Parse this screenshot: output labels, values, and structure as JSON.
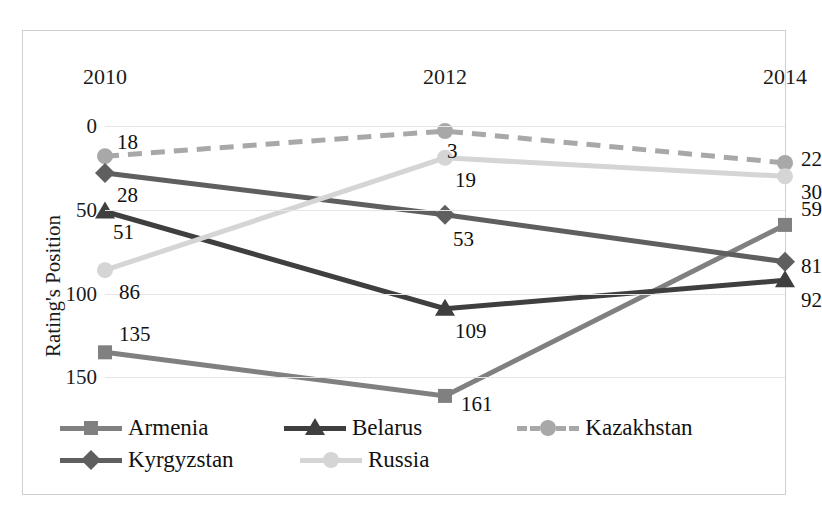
{
  "chart_data": {
    "type": "line",
    "title": "",
    "xlabel": "",
    "ylabel": "Rating's Position",
    "categories": [
      "2010",
      "2012",
      "2014"
    ],
    "x_tick_labels": [
      "2010",
      "2012",
      "2014"
    ],
    "y_tick_labels": [
      "0",
      "50",
      "100",
      "150"
    ],
    "y_ticks": [
      0,
      50,
      100,
      150
    ],
    "ylim": [
      0,
      170
    ],
    "y_axis_inverted": true,
    "grid": true,
    "legend_position": "bottom",
    "series": [
      {
        "name": "Armenia",
        "values": [
          135,
          161,
          59
        ],
        "labels": [
          "135",
          "161",
          "59"
        ],
        "color": "#808080",
        "marker": "square",
        "dash": "solid"
      },
      {
        "name": "Belarus",
        "values": [
          51,
          109,
          92
        ],
        "labels": [
          "51",
          "109",
          "92"
        ],
        "color": "#3f3f3f",
        "marker": "triangle",
        "dash": "solid"
      },
      {
        "name": "Kazakhstan",
        "values": [
          18,
          3,
          22
        ],
        "labels": [
          "18",
          "3",
          "22"
        ],
        "color": "#a8a8a8",
        "marker": "circle",
        "dash": "dashed"
      },
      {
        "name": "Kyrgyzstan",
        "values": [
          28,
          53,
          81
        ],
        "labels": [
          "28",
          "53",
          "81"
        ],
        "color": "#5f5f5f",
        "marker": "diamond",
        "dash": "solid"
      },
      {
        "name": "Russia",
        "values": [
          86,
          19,
          30
        ],
        "labels": [
          "86",
          "19",
          "30"
        ],
        "color": "#d5d5d5",
        "marker": "circle",
        "dash": "solid"
      }
    ]
  },
  "legend": {
    "rows": [
      [
        "Armenia",
        "Belarus",
        "Kazakhstan"
      ],
      [
        "Kyrgyzstan",
        "Russia"
      ]
    ]
  }
}
